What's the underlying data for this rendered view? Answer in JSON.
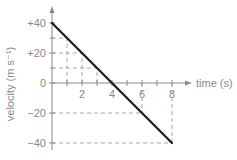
{
  "chart_data": {
    "type": "line",
    "title": "",
    "xlabel": "time (s)",
    "ylabel": "velocity (m s⁻¹)",
    "xlim": [
      0,
      9
    ],
    "ylim": [
      -40,
      40
    ],
    "x_ticks": [
      2,
      4,
      6,
      8
    ],
    "x_minor_ticks": [
      1,
      2,
      3,
      4,
      5,
      6,
      7,
      8
    ],
    "y_ticks": [
      40,
      20,
      0,
      -20,
      -40
    ],
    "y_tick_labels": [
      "+40",
      "+20",
      "0",
      "-20",
      "-40"
    ],
    "grid": "partial dashed guide lines",
    "series": [
      {
        "name": "velocity",
        "x": [
          0,
          1,
          2,
          3,
          4,
          5,
          6,
          7,
          8
        ],
        "values": [
          40,
          30,
          20,
          10,
          0,
          -10,
          -20,
          -30,
          -40
        ]
      }
    ],
    "guides": {
      "horizontal": [
        {
          "y": 30,
          "x_end": 1
        },
        {
          "y": 20,
          "x_end": 2
        },
        {
          "y": 10,
          "x_end": 3
        },
        {
          "y": -20,
          "x_end": 6
        },
        {
          "y": -40,
          "x_end": 8
        }
      ],
      "vertical": [
        {
          "x": 1,
          "y_end": 30
        },
        {
          "x": 2,
          "y_end": 20
        },
        {
          "x": 3,
          "y_end": 10
        },
        {
          "x": 6,
          "y_end": -20
        },
        {
          "x": 8,
          "y_end": -40
        }
      ]
    },
    "colors": {
      "line": "#1a1a1a",
      "axis": "#8a8a8a",
      "guide": "#aaaaaa",
      "text": "#8a8a8a"
    }
  }
}
